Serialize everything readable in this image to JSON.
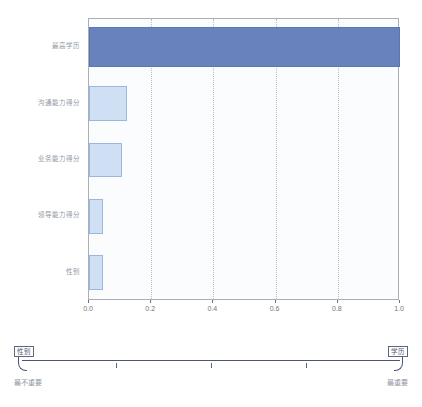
{
  "chart_data": {
    "type": "bar",
    "orientation": "horizontal",
    "title": "",
    "xlabel": "",
    "ylabel": "",
    "xlim": [
      0.0,
      1.0
    ],
    "grid": true,
    "legend": "none",
    "categories": [
      "最高学历",
      "沟通能力得分",
      "业务能力得分",
      "领导能力得分",
      "性别"
    ],
    "values": [
      1.0,
      0.122,
      0.107,
      0.045,
      0.045
    ],
    "tick_labels": [
      "0.0",
      "0.2",
      "0.4",
      "0.6",
      "0.8",
      "1.0"
    ],
    "tick_values": [
      0.0,
      0.2,
      0.4,
      0.6,
      0.8,
      1.0
    ],
    "colors": {
      "primary_bar": "#6782bd",
      "primary_bar_border": "#5c76b0",
      "secondary_bar": "#cfe0f5",
      "secondary_bar_border": "#9bb8da",
      "plot_background": "#fbfcfe",
      "plot_border": "#a9aeb8",
      "gridline": "#b9bec8",
      "label_text": "#8f96a3",
      "scale_line": "#4a5578"
    },
    "bars": [
      {
        "label": "最高学历",
        "value": 1.0,
        "style": "primary"
      },
      {
        "label": "沟通能力得分",
        "value": 0.122,
        "style": "secondary"
      },
      {
        "label": "业务能力得分",
        "value": 0.107,
        "style": "secondary"
      },
      {
        "label": "领导能力得分",
        "value": 0.045,
        "style": "secondary"
      },
      {
        "label": "性别",
        "value": 0.045,
        "style": "secondary"
      }
    ]
  },
  "importance_scale": {
    "marker_left_label": "性别",
    "marker_right_label": "学历",
    "end_label_left": "最不重要",
    "end_label_right": "最重要",
    "tick_positions": [
      0.25,
      0.5,
      0.75
    ]
  }
}
